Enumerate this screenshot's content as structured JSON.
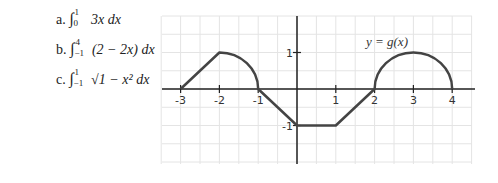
{
  "problems": [
    {
      "label": "a.",
      "upper": "1",
      "lower": "0",
      "integrand": "3x",
      "d": "dx"
    },
    {
      "label": "b.",
      "upper": "4",
      "lower": "−1",
      "integrand": "(2 − 2x)",
      "d": "dx"
    },
    {
      "label": "c.",
      "upper": "1",
      "lower": "−1",
      "integrand": "√1 − x²",
      "d": "dx"
    }
  ],
  "graph": {
    "function_label": "y = g(x)",
    "x_ticks": [
      "-3",
      "-2",
      "-1",
      "1",
      "2",
      "3",
      "4"
    ],
    "y_ticks": [
      "1",
      "-1"
    ]
  },
  "chart_data": {
    "type": "line",
    "title": "y = g(x)",
    "xlabel": "",
    "ylabel": "",
    "xlim": [
      -3.5,
      4.5
    ],
    "ylim": [
      -2,
      2
    ],
    "grid": true,
    "segments": [
      {
        "kind": "line",
        "points": [
          [
            -3,
            0
          ],
          [
            -2,
            1
          ]
        ]
      },
      {
        "kind": "quarter-circle",
        "center": [
          -2,
          0
        ],
        "radius": 1,
        "from": [
          -2,
          1
        ],
        "to": [
          -1,
          0
        ]
      },
      {
        "kind": "line",
        "points": [
          [
            -1,
            0
          ],
          [
            0,
            -1
          ]
        ]
      },
      {
        "kind": "line",
        "points": [
          [
            0,
            -1
          ],
          [
            1,
            -1
          ]
        ]
      },
      {
        "kind": "line",
        "points": [
          [
            1,
            -1
          ],
          [
            2,
            0
          ]
        ]
      },
      {
        "kind": "semicircle",
        "center": [
          3,
          0
        ],
        "radius": 1,
        "from": [
          2,
          0
        ],
        "to": [
          4,
          0
        ]
      }
    ]
  }
}
